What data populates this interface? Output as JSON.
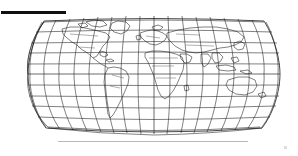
{
  "figure": {
    "title": "",
    "kind": "world-map",
    "background_color": "#ffffff",
    "line_color": "#1a1a1a",
    "graticule_color": "#2b2b2b",
    "rule_color": "#101010",
    "baseline_color": "#b8b8b8"
  },
  "rule": {
    "label": "",
    "x": 1,
    "y": 11,
    "width": 65,
    "height": 3
  },
  "map": {
    "projection": "Robinson",
    "center_longitude": 0,
    "center_x": 154,
    "center_y": 74,
    "half_width": 126,
    "half_height": 63,
    "outline_visible": true,
    "coastlines_visible": true,
    "country_borders_visible": true,
    "graticule": {
      "visible": true,
      "meridian_step_deg": 20,
      "parallel_step_deg": 15,
      "meridians": [
        -180,
        -160,
        -140,
        -120,
        -100,
        -80,
        -60,
        -40,
        -20,
        0,
        20,
        40,
        60,
        80,
        100,
        120,
        140,
        160,
        180
      ],
      "parallels": [
        -75,
        -60,
        -45,
        -30,
        -15,
        0,
        15,
        30,
        45,
        60,
        75
      ]
    },
    "antarctica_baseline_visible": true
  },
  "corner_mark": {
    "visible": true,
    "x": 284,
    "y": 146
  }
}
